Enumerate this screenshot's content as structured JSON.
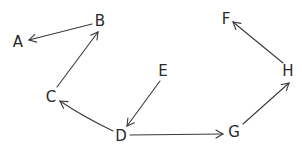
{
  "diagram": {
    "type": "directed-graph",
    "style": "hand-drawn",
    "colors": {
      "ink": "#2a2a2a",
      "edge": "#3a3a3a",
      "background": "#ffffff"
    },
    "nodes": [
      {
        "id": "A",
        "label": "A",
        "x": 18,
        "y": 42
      },
      {
        "id": "B",
        "label": "B",
        "x": 99,
        "y": 22
      },
      {
        "id": "C",
        "label": "C",
        "x": 52,
        "y": 97
      },
      {
        "id": "D",
        "label": "D",
        "x": 121,
        "y": 135
      },
      {
        "id": "E",
        "label": "E",
        "x": 163,
        "y": 71
      },
      {
        "id": "F",
        "label": "F",
        "x": 226,
        "y": 19
      },
      {
        "id": "G",
        "label": "G",
        "x": 234,
        "y": 132
      },
      {
        "id": "H",
        "label": "H",
        "x": 288,
        "y": 71
      }
    ],
    "edges": [
      {
        "from": "B",
        "to": "A",
        "curved": false
      },
      {
        "from": "C",
        "to": "B",
        "curved": false
      },
      {
        "from": "D",
        "to": "C",
        "curved": true
      },
      {
        "from": "E",
        "to": "D",
        "curved": false
      },
      {
        "from": "D",
        "to": "G",
        "curved": false
      },
      {
        "from": "G",
        "to": "H",
        "curved": false
      },
      {
        "from": "H",
        "to": "F",
        "curved": false
      }
    ]
  }
}
